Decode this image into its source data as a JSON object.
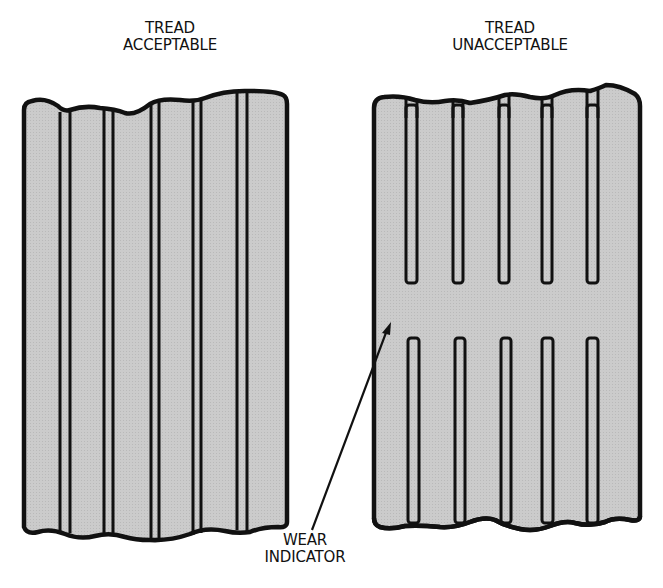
{
  "diagram": {
    "left_panel": {
      "title_line1": "TREAD",
      "title_line2": "ACCEPTABLE",
      "description": "Tire tread with continuous longitudinal grooves"
    },
    "right_panel": {
      "title_line1": "TREAD",
      "title_line2": "UNACCEPTABLE",
      "description": "Tire tread worn to wear indicator bar across grooves"
    },
    "callout": {
      "line1": "WEAR",
      "line2": "INDICATOR",
      "target": "right_panel"
    },
    "colors": {
      "tread_fill": "#c8c8c8",
      "outline": "#111111",
      "background": "#ffffff"
    }
  }
}
